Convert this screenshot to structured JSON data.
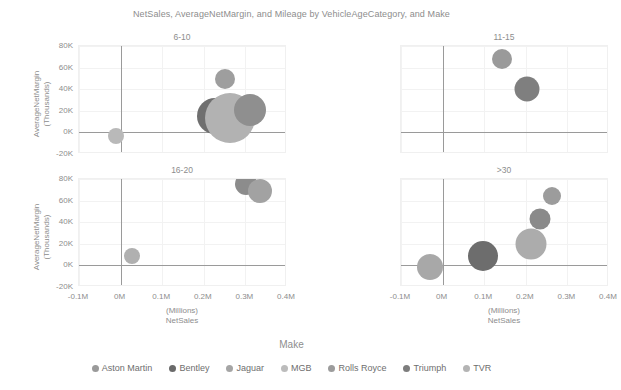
{
  "chart_data": {
    "type": "scatter",
    "title": "NetSales, AverageNetMargin, and Mileage by VehicleAgeCategory, and Make",
    "xlabel_line1": "(Millions)",
    "xlabel_line2": "NetSales",
    "ylabel_line1": "AverageNetMargin",
    "ylabel_line2": "(Thousands)",
    "xlim": [
      -0.1,
      0.4
    ],
    "ylim": [
      -20,
      80
    ],
    "xticks": [
      "-0.1M",
      "0M",
      "0.1M",
      "0.2M",
      "0.3M",
      "0.4M"
    ],
    "xtick_values": [
      -0.1,
      0,
      0.1,
      0.2,
      0.3,
      0.4
    ],
    "yticks": [
      "80K",
      "60K",
      "40K",
      "20K",
      "0K",
      "-20K"
    ],
    "ytick_values": [
      80,
      60,
      40,
      20,
      0,
      -20
    ],
    "grid": true,
    "legend_position": "bottom",
    "legend_title": "Make",
    "size_encodes": "Mileage",
    "facet_by": "VehicleAgeCategory",
    "series": [
      {
        "name": "Aston Martin",
        "color": "#9a9a9a"
      },
      {
        "name": "Bentley",
        "color": "#6a6a6a"
      },
      {
        "name": "Jaguar",
        "color": "#a5a5a5"
      },
      {
        "name": "MGB",
        "color": "#bcbcbc"
      },
      {
        "name": "Rolls Royce",
        "color": "#9c9c9c"
      },
      {
        "name": "Triumph",
        "color": "#7d7d7d"
      },
      {
        "name": "TVR",
        "color": "#b4b4b4"
      }
    ],
    "panels": [
      {
        "id": "panel-6-10",
        "title": "6-10",
        "points": [
          {
            "make": "MGB",
            "x": -0.012,
            "y": -3.5,
            "size": 8,
            "color": "#b9b9b9"
          },
          {
            "make": "Bentley",
            "x": 0.228,
            "y": 15.0,
            "size": 18,
            "color": "#6f6f6f"
          },
          {
            "make": "Jaguar",
            "x": 0.264,
            "y": 13.5,
            "size": 25,
            "color": "#b2b2b2"
          },
          {
            "make": "Aston Martin",
            "x": 0.25,
            "y": 49.0,
            "size": 10,
            "color": "#9e9e9e"
          },
          {
            "make": "Triumph",
            "x": 0.312,
            "y": 21.0,
            "size": 16,
            "color": "#8f8f8f"
          }
        ]
      },
      {
        "id": "panel-11-15",
        "title": "11-15",
        "points": [
          {
            "make": "Rolls Royce",
            "x": 0.142,
            "y": 68.0,
            "size": 10,
            "color": "#9a9a9a"
          },
          {
            "make": "Triumph",
            "x": 0.202,
            "y": 40.0,
            "size": 12.5,
            "color": "#7f7f7f"
          }
        ]
      },
      {
        "id": "panel-16-20",
        "title": "16-20",
        "points": [
          {
            "make": "MGB",
            "x": 0.028,
            "y": 8.5,
            "size": 8,
            "color": "#b0b0b0"
          },
          {
            "make": "Rolls Royce",
            "x": 0.302,
            "y": 75.0,
            "size": 11,
            "color": "#8c8c8c"
          },
          {
            "make": "TVR",
            "x": 0.336,
            "y": 68.5,
            "size": 12,
            "color": "#a2a2a2"
          }
        ]
      },
      {
        "id": "panel-gt30",
        "title": ">30",
        "points": [
          {
            "make": "MGB",
            "x": -0.03,
            "y": -1.5,
            "size": 13,
            "color": "#a8a8a8"
          },
          {
            "make": "Bentley",
            "x": 0.098,
            "y": 8.5,
            "size": 15,
            "color": "#6d6d6d"
          },
          {
            "make": "Jaguar",
            "x": 0.212,
            "y": 19.5,
            "size": 15.5,
            "color": "#acacac"
          },
          {
            "make": "Triumph",
            "x": 0.234,
            "y": 43.0,
            "size": 10.5,
            "color": "#8a8a8a"
          },
          {
            "make": "Aston Martin",
            "x": 0.262,
            "y": 64.0,
            "size": 9,
            "color": "#9c9c9c"
          }
        ]
      }
    ]
  }
}
